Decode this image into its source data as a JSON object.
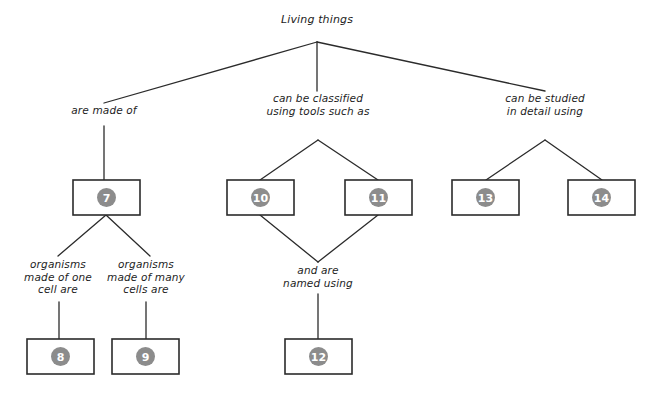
{
  "diagram": {
    "type": "concept-map",
    "title": "Living things",
    "background_color": "#ffffff",
    "line_color": "#2b2b2b",
    "circle_color": "#8c8c8c",
    "circle_text_color": "#ffffff",
    "box_fill": "#ffffff",
    "labels": {
      "root": "Living things",
      "branch_left": "are made of",
      "branch_middle_line1": "can be classified",
      "branch_middle_line2": "using tools such as",
      "branch_right_line1": "can be studied",
      "branch_right_line2": "in detail using",
      "sub_left_line1": "organisms",
      "sub_left_line2": "made of one",
      "sub_left_line3": "cell are",
      "sub_right_line1": "organisms",
      "sub_right_line2": "made of many",
      "sub_right_line3": "cells are",
      "sub_middle_line1": "and are",
      "sub_middle_line2": "named using"
    },
    "boxes": [
      {
        "id": "box-7",
        "number": "7",
        "x": 73,
        "y": 180,
        "w": 67,
        "h": 35
      },
      {
        "id": "box-8",
        "number": "8",
        "x": 27,
        "y": 339,
        "w": 67,
        "h": 35
      },
      {
        "id": "box-9",
        "number": "9",
        "x": 112,
        "y": 339,
        "w": 67,
        "h": 35
      },
      {
        "id": "box-10",
        "number": "10",
        "x": 227,
        "y": 180,
        "w": 67,
        "h": 35
      },
      {
        "id": "box-11",
        "number": "11",
        "x": 345,
        "y": 180,
        "w": 67,
        "h": 35
      },
      {
        "id": "box-12",
        "number": "12",
        "x": 285,
        "y": 339,
        "w": 67,
        "h": 35
      },
      {
        "id": "box-13",
        "number": "13",
        "x": 452,
        "y": 180,
        "w": 67,
        "h": 35
      },
      {
        "id": "box-14",
        "number": "14",
        "x": 568,
        "y": 180,
        "w": 67,
        "h": 35
      }
    ],
    "text_positions": {
      "root": {
        "x": 317,
        "y": 21
      },
      "branch_left": {
        "x": 104,
        "y": 110
      },
      "branch_middle": {
        "x": 318,
        "y": 98
      },
      "branch_right": {
        "x": 545,
        "y": 98
      },
      "sub_left": {
        "x": 58,
        "y": 262
      },
      "sub_right": {
        "x": 146,
        "y": 262
      },
      "sub_middle": {
        "x": 318,
        "y": 268
      }
    },
    "connectors": [
      {
        "id": "root-to-left",
        "points": "317,42 104,103"
      },
      {
        "id": "root-to-middle",
        "points": "317,42 317,91"
      },
      {
        "id": "root-to-right",
        "points": "317,42 545,91"
      },
      {
        "id": "left-to-box7",
        "points": "104,126 104,180"
      },
      {
        "id": "box7-to-subleft",
        "points": "106,215 58,256"
      },
      {
        "id": "box7-to-subright",
        "points": "106,215 150,256"
      },
      {
        "id": "subleft-to-box8",
        "points": "59,302 59,339"
      },
      {
        "id": "subright-to-box9",
        "points": "146,302 146,339"
      },
      {
        "id": "middle-to-box10",
        "points": "318,140 260,180"
      },
      {
        "id": "middle-to-box11",
        "points": "318,140 378,180"
      },
      {
        "id": "box10-to-join",
        "points": "260,215 318,262"
      },
      {
        "id": "box11-to-join",
        "points": "378,215 318,262"
      },
      {
        "id": "join-to-box12",
        "points": "318,294 318,339"
      },
      {
        "id": "right-to-box13",
        "points": "545,140 486,180"
      },
      {
        "id": "right-to-box14",
        "points": "545,140 602,180"
      }
    ]
  }
}
